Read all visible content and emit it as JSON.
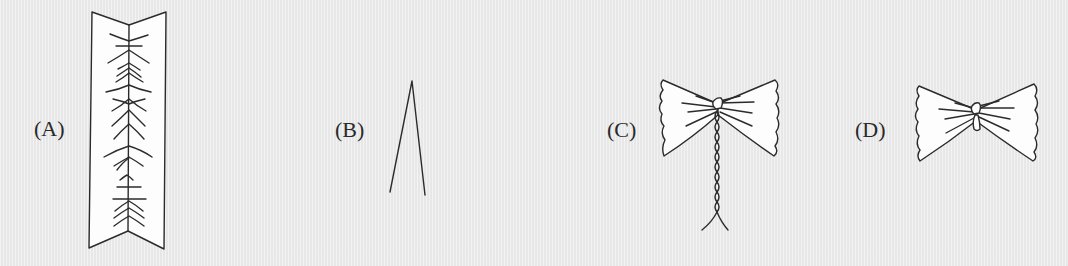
{
  "figure": {
    "panels": [
      {
        "id": "A",
        "label": "(A)",
        "description": "folded rectangular strip with herringbone pleat marks along center fold"
      },
      {
        "id": "B",
        "label": "(B)",
        "description": "inverted V shape (two lines meeting at apex)"
      },
      {
        "id": "C",
        "label": "(C)",
        "description": "bow shape with twisted braided tail splitting at bottom"
      },
      {
        "id": "D",
        "label": "(D)",
        "description": "bow shape with knot in center"
      }
    ],
    "colors": {
      "background": "#ececec",
      "line": "#2b2b2b",
      "fill": "#fdfdfd"
    }
  }
}
